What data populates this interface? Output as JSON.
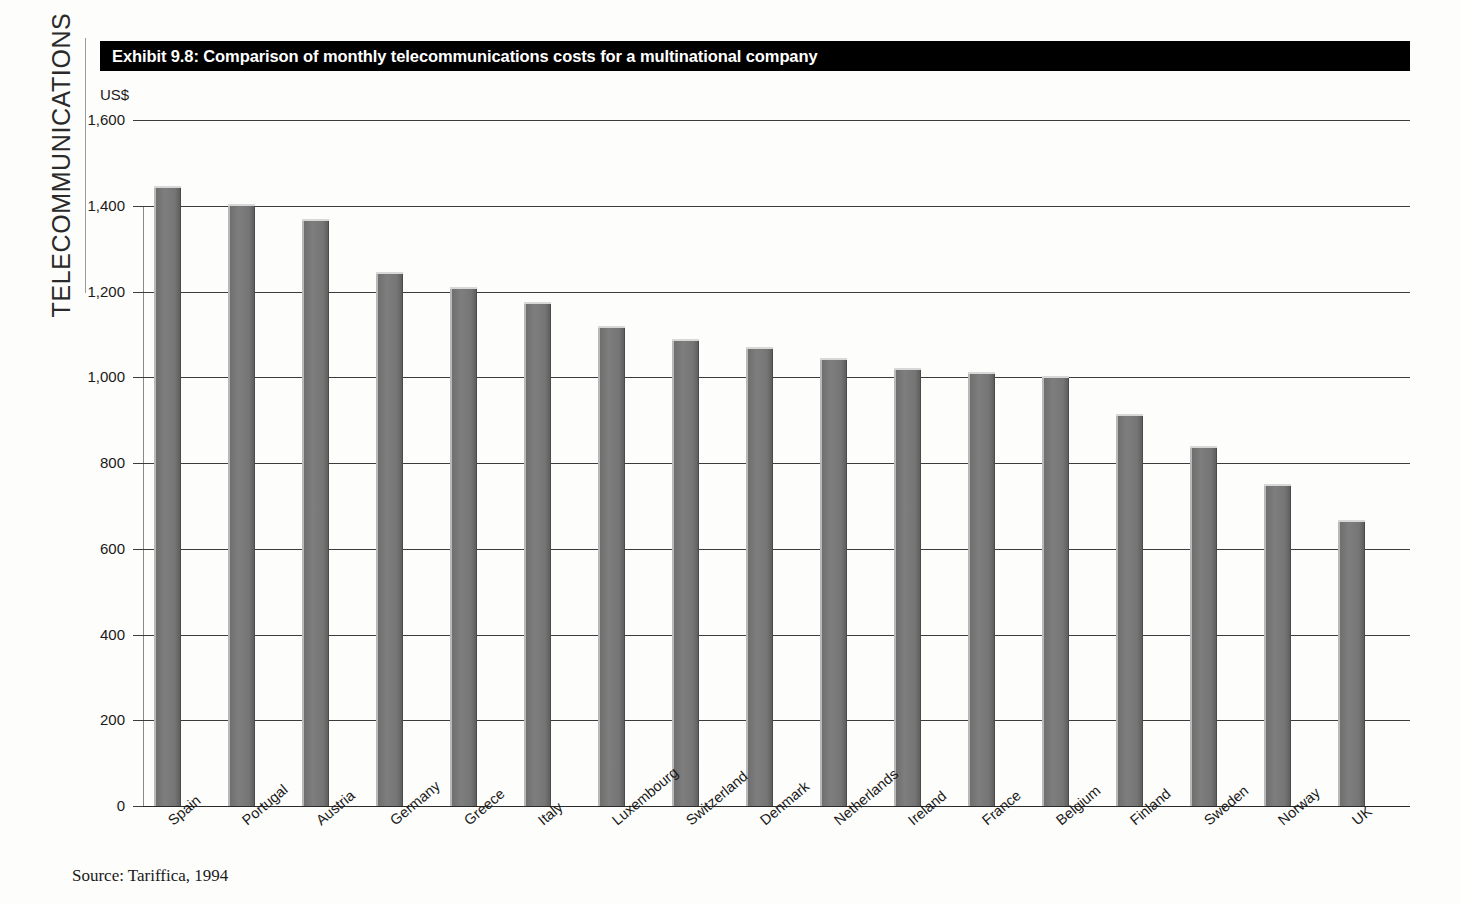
{
  "sidebar": {
    "running_head": "TELECOMMUNICATIONS"
  },
  "banner": {
    "title": "Exhibit 9.8: Comparison of monthly telecommunications costs for a multinational company"
  },
  "source_note": "Source: Tariffica, 1994",
  "colors": {
    "banner_background": "#000000",
    "banner_text": "#ffffff",
    "bar_fill": "#7c7c7c",
    "bar_highlight": "#d8d8d8",
    "bar_shadow": "#4a4a4a",
    "gridline": "#3c3c3c",
    "page_background": "#fdfdfb"
  },
  "chart_data": {
    "type": "bar",
    "title": "Exhibit 9.8: Comparison of monthly telecommunications costs for a multinational company",
    "xlabel": "",
    "ylabel": "US$",
    "unit_label": "US$",
    "ylim": [
      0,
      1600
    ],
    "ytick_labels": [
      "0",
      "200",
      "400",
      "600",
      "800",
      "1,000",
      "1,200",
      "1,400",
      "1,600"
    ],
    "yticks": [
      0,
      200,
      400,
      600,
      800,
      1000,
      1200,
      1400,
      1600
    ],
    "grid": true,
    "legend": null,
    "source": "Tariffica, 1994",
    "categories": [
      "Spain",
      "Portugal",
      "Austria",
      "Germany",
      "Greece",
      "Italy",
      "Luxembourg",
      "Switzerland",
      "Denmark",
      "Netherlands",
      "Ireland",
      "France",
      "Belgium",
      "Finland",
      "Sweden",
      "Norway",
      "UK"
    ],
    "values": [
      1445,
      1405,
      1370,
      1245,
      1210,
      1175,
      1120,
      1090,
      1070,
      1045,
      1022,
      1012,
      1003,
      915,
      840,
      750,
      668
    ]
  }
}
